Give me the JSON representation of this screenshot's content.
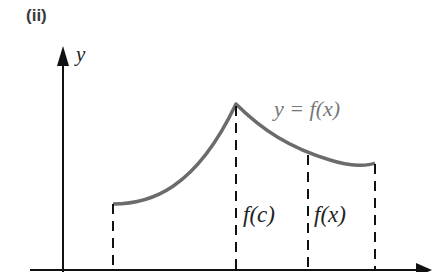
{
  "panel_label": "(ii)",
  "axes": {
    "y_label": "y",
    "x_label": ""
  },
  "curve_label": "y = f(x)",
  "segment_labels": {
    "fc": "f(c)",
    "fx": "f(x)"
  },
  "colors": {
    "curve": "#6b6b6b",
    "axes": "#111111",
    "dashes": "#111111",
    "curve_label": "#777777"
  }
}
